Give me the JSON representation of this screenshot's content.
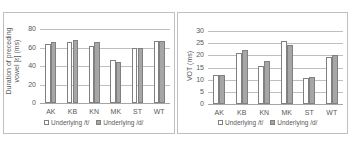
{
  "chart_data": [
    {
      "type": "bar",
      "title": "",
      "xlabel": "",
      "ylabel": "Duration of preceding vowel [ɛ] (ms)",
      "categories": [
        "AK",
        "KB",
        "KN",
        "MK",
        "ST",
        "WT"
      ],
      "series": [
        {
          "name": "Underlying /t/",
          "values": [
            64,
            66,
            62,
            47,
            60,
            67.5
          ],
          "color": "#ffffff"
        },
        {
          "name": "Underlying /d/",
          "values": [
            66,
            68,
            66,
            44.5,
            59,
            67.5
          ],
          "color": "#a6a6a6"
        }
      ],
      "yticks": [
        "0",
        "20",
        "40",
        "60",
        "80"
      ],
      "ylim": [
        0,
        80
      ],
      "grid": true,
      "legend_position": "bottom"
    },
    {
      "type": "bar",
      "title": "",
      "xlabel": "",
      "ylabel": "VOT (ms)",
      "categories": [
        "AK",
        "KB",
        "KN",
        "MK",
        "ST",
        "WT"
      ],
      "series": [
        {
          "name": "Underlying /t/",
          "values": [
            12,
            21,
            15.5,
            26,
            10.5,
            19.2
          ],
          "color": "#ffffff"
        },
        {
          "name": "Underlying /d/",
          "values": [
            12,
            22,
            17.7,
            24.3,
            11,
            20.3
          ],
          "color": "#a6a6a6"
        }
      ],
      "yticks": [
        "0",
        "5",
        "10",
        "15",
        "20",
        "25",
        "30"
      ],
      "ylim": [
        0,
        30
      ],
      "grid": true,
      "legend_position": "bottom"
    }
  ],
  "left": {
    "ylabel": "Duration of preceding vowel [ɛ] (ms)",
    "legend_t": "Underlying /t/",
    "legend_d": "Underlying /d/"
  },
  "right": {
    "ylabel": "VOT (ms)",
    "legend_t": "Underlying /t/",
    "legend_d": "Underlying /d/"
  }
}
